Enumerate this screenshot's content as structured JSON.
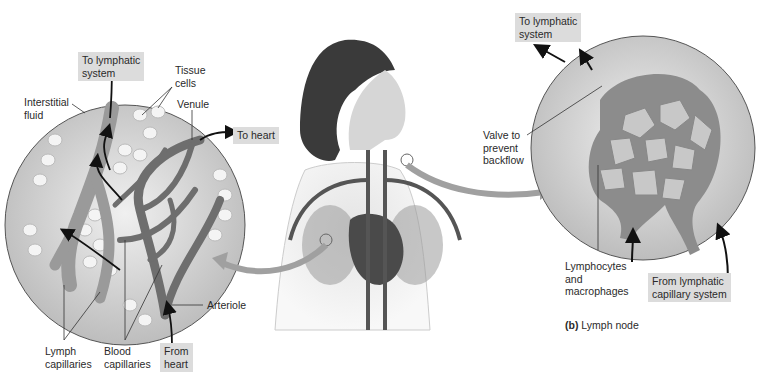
{
  "figure": {
    "panel_a": {
      "labels": {
        "to_lymphatic": "To lymphatic\nsystem",
        "tissue_cells": "Tissue\ncells",
        "interstitial_fluid": "Interstitial\nfluid",
        "venule": "Venule",
        "to_heart": "To heart",
        "arteriole": "Arteriole",
        "lymph_capillaries": "Lymph\ncapillaries",
        "blood_capillaries": "Blood\ncapillaries",
        "from_heart": "From\nheart"
      }
    },
    "panel_b": {
      "labels": {
        "to_lymphatic": "To lymphatic\nsystem",
        "valve": "Valve to\nprevent\nbackflow",
        "lymphocytes": "Lymphocytes\nand\nmacrophages",
        "from_lymphatic_capillary": "From lymphatic\ncapillary system"
      },
      "caption_letter": "(b)",
      "caption_text": " Lymph node"
    },
    "colors": {
      "label_box": "#dcdcdc",
      "circle_fill": "#d8d8d8",
      "vessel": "#7a7a7a",
      "arrow": "#111111"
    }
  }
}
